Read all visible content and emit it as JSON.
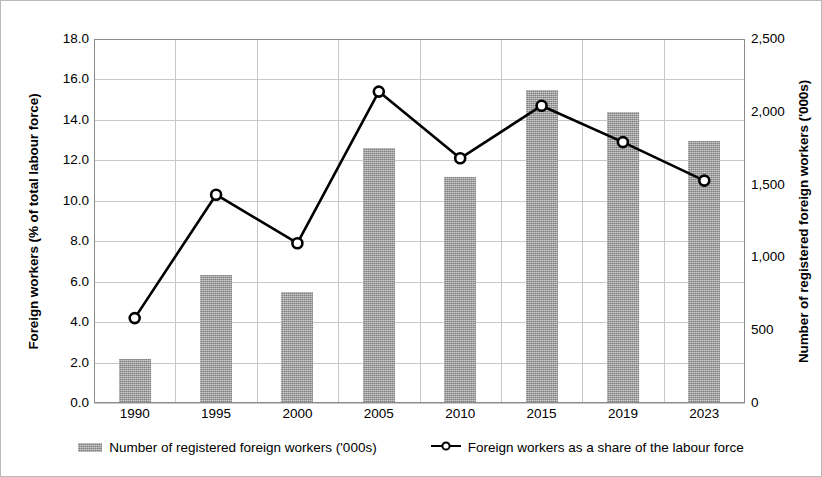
{
  "chart_data": {
    "type": "bar",
    "title": "",
    "subtitle": "",
    "xlabel": "",
    "categories": [
      "1990",
      "1995",
      "2000",
      "2005",
      "2010",
      "2015",
      "2019",
      "2023"
    ],
    "grid": true,
    "legend_position": "bottom",
    "series": [
      {
        "name": "Number of registered foreign workers ('000s)",
        "type": "bar",
        "axis": "right",
        "color": "#9b9b9b",
        "values": [
          300,
          880,
          760,
          1750,
          1550,
          2150,
          2000,
          1800
        ]
      },
      {
        "name": "Foreign workers as a share of the labour force",
        "type": "line",
        "axis": "left",
        "color": "#000000",
        "marker": "circle-open",
        "values": [
          4.2,
          10.3,
          7.9,
          15.4,
          12.1,
          14.7,
          12.9,
          11.0
        ]
      }
    ],
    "axes": {
      "left": {
        "label": "Foreign workers (% of total labour force)",
        "ticks": [
          "0.0",
          "2.0",
          "4.0",
          "6.0",
          "8.0",
          "10.0",
          "12.0",
          "14.0",
          "16.0",
          "18.0"
        ],
        "tick_values": [
          0,
          2,
          4,
          6,
          8,
          10,
          12,
          14,
          16,
          18
        ],
        "ylim": [
          0,
          18
        ]
      },
      "right": {
        "label": "Number of registered foreign workers ('000s)",
        "ticks": [
          "0",
          "500",
          "1,000",
          "1,500",
          "2,000",
          "2,500"
        ],
        "tick_values": [
          0,
          500,
          1000,
          1500,
          2000,
          2500
        ],
        "ylim": [
          0,
          2500
        ]
      }
    },
    "legend": [
      {
        "label": "Number of registered foreign workers ('000s)",
        "marker": "bar-swatch"
      },
      {
        "label": "Foreign workers as a share of the labour force",
        "marker": "line-open-circle"
      }
    ]
  }
}
